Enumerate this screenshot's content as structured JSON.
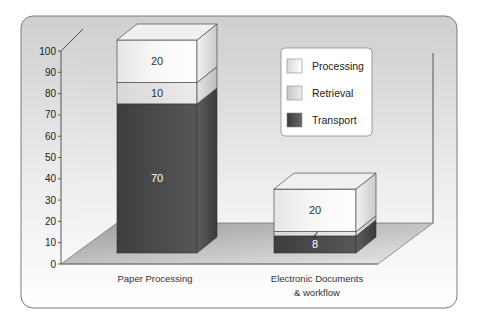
{
  "chart_data": {
    "type": "bar",
    "subtype": "stacked-3d",
    "title": "",
    "xlabel": "",
    "ylabel": "",
    "ylim": [
      0,
      100
    ],
    "yticks": [
      0,
      10,
      20,
      30,
      40,
      50,
      60,
      70,
      80,
      90,
      100
    ],
    "categories": [
      "Paper Processing",
      "Electronic Documents & workflow"
    ],
    "category_label_lines": [
      [
        "Paper Processing"
      ],
      [
        "Electronic Documents",
        "& workflow"
      ]
    ],
    "series": [
      {
        "name": "Transport",
        "values": [
          70,
          8
        ],
        "color": "#4a4a4a"
      },
      {
        "name": "Retrieval",
        "values": [
          10,
          2
        ],
        "color": "#e2e2e2"
      },
      {
        "name": "Processing",
        "values": [
          20,
          20
        ],
        "color": "#f2f2f2"
      }
    ],
    "legend": {
      "position": "top-right-inside",
      "entries": [
        "Processing",
        "Retrieval",
        "Transport"
      ]
    },
    "data_labels": true,
    "grid": false
  }
}
